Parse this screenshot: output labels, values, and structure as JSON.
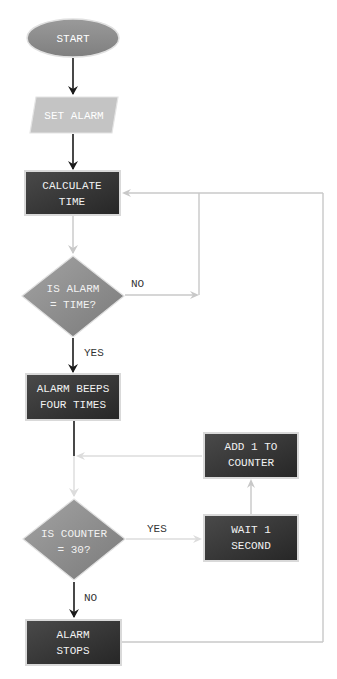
{
  "colors": {
    "terminal_fill": "#8c8c8c",
    "io_fill": "#c4c4c4",
    "process_fill": "#333333",
    "decision_fill": "#8f8f8f",
    "shape_border": "#d9d9d9",
    "arrow_dark": "#1a1a1a",
    "arrow_light": "#c8c8c8"
  },
  "nodes": {
    "start": {
      "type": "terminal",
      "line1": "START"
    },
    "set_alarm": {
      "type": "input-output",
      "line1": "SET ALARM"
    },
    "calculate_time": {
      "type": "process",
      "line1": "CALCULATE",
      "line2": "TIME"
    },
    "is_alarm_time": {
      "type": "decision",
      "line1": "IS ALARM",
      "line2": "= TIME?"
    },
    "alarm_beeps": {
      "type": "process",
      "line1": "ALARM BEEPS",
      "line2": "FOUR TIMES"
    },
    "add_counter": {
      "type": "process",
      "line1": "ADD 1 TO",
      "line2": "COUNTER"
    },
    "is_counter_30": {
      "type": "decision",
      "line1": "IS COUNTER",
      "line2": "= 30?"
    },
    "wait_second": {
      "type": "process",
      "line1": "WAIT 1",
      "line2": "SECOND"
    },
    "alarm_stops": {
      "type": "process",
      "line1": "ALARM",
      "line2": "STOPS"
    }
  },
  "edges": {
    "alarm_no": "NO",
    "alarm_yes": "YES",
    "counter_yes": "YES",
    "counter_no": "NO"
  }
}
